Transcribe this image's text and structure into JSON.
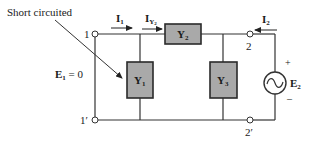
{
  "diagram": {
    "type": "two-port circuit schematic",
    "annotation": {
      "text": "Short circuited",
      "points_to": "port-1-short"
    },
    "nodes": [
      {
        "id": "1",
        "label": "1"
      },
      {
        "id": "1p",
        "label": "1′"
      },
      {
        "id": "2",
        "label": "2"
      },
      {
        "id": "2p",
        "label": "2′"
      }
    ],
    "elements": {
      "Y1": {
        "main": "Y",
        "sub": "1",
        "role": "shunt admittance at port 1"
      },
      "Y2": {
        "main": "Y",
        "sub": "2",
        "role": "series admittance"
      },
      "Y3": {
        "main": "Y",
        "sub": "3",
        "role": "shunt admittance at port 2"
      }
    },
    "currents": {
      "I1": {
        "main": "I",
        "sub": "1",
        "direction": "right"
      },
      "IY2": {
        "main": "I",
        "sub": "Y",
        "subsub": "2",
        "direction": "right"
      },
      "I2": {
        "main": "I",
        "sub": "2",
        "direction": "left"
      }
    },
    "sources": {
      "E1": {
        "main": "E",
        "sub": "1",
        "value_text": " = 0"
      },
      "E2": {
        "main": "E",
        "sub": "2",
        "plus": "+",
        "minus": "–",
        "icon": "ac-source-icon"
      }
    },
    "colors": {
      "box_fill": "#a9a9a9",
      "line": "#333333",
      "background": "#ffffff"
    }
  }
}
